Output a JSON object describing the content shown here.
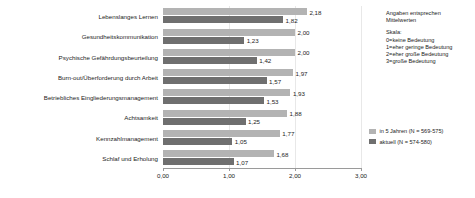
{
  "chart_data": {
    "type": "bar",
    "orientation": "horizontal",
    "title": "",
    "xlabel": "",
    "ylabel": "",
    "xlim": [
      0,
      3
    ],
    "xticks": [
      "0,00",
      "1,00",
      "2,00",
      "3,00"
    ],
    "xtick_values": [
      0,
      1,
      2,
      3
    ],
    "grid": true,
    "legend_position": "right",
    "categories": [
      "Lebenslanges Lernen",
      "Gesundheitskommunikation",
      "Psychische Gefährdungsbeurteilung",
      "Burn-out/Überforderung durch Arbeit",
      "Betriebliches Eingliederungsmanagement",
      "Achtsamkeit",
      "Kennzahlmanagement",
      "Schlaf und Erholung"
    ],
    "series": [
      {
        "name": "in 5 Jahren (N = 569-575)",
        "color": "#b3b3b3",
        "values": [
          2.18,
          2.0,
          2.0,
          1.97,
          1.93,
          1.88,
          1.77,
          1.68
        ],
        "labels": [
          "2,18",
          "2,00",
          "2,00",
          "1,97",
          "1,93",
          "1,88",
          "1,77",
          "1,68"
        ]
      },
      {
        "name": "aktuell (N = 574-580)",
        "color": "#6f6f6f",
        "values": [
          1.82,
          1.23,
          1.42,
          1.57,
          1.53,
          1.25,
          1.05,
          1.07
        ],
        "labels": [
          "1,82",
          "1,23",
          "1,42",
          "1,57",
          "1,53",
          "1,25",
          "1,05",
          "1,07"
        ]
      }
    ],
    "annotations": [
      "Angaben entsprechen",
      "Mittelwerten",
      "Skala:",
      "0=keine Bedeutung",
      "1=eher geringe Bedeutung",
      "2=eher große Bedeutung",
      "3=große Bedeutung"
    ]
  },
  "notes": {
    "intro": [
      "Angaben entsprechen",
      "Mittelwerten"
    ],
    "scale_title": "Skala:",
    "scale_items": [
      "0=keine Bedeutung",
      "1=eher geringe Bedeutung",
      "2=eher große Bedeutung",
      "3=große Bedeutung"
    ]
  },
  "legend": {
    "items": [
      {
        "label": "in 5 Jahren (N = 569-575)",
        "color": "#b3b3b3"
      },
      {
        "label": "aktuell (N = 574-580)",
        "color": "#6f6f6f"
      }
    ]
  }
}
